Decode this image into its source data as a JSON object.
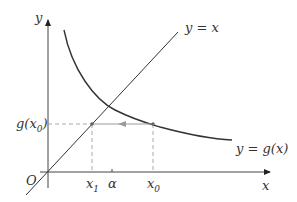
{
  "diagram": {
    "type": "fixed-point-iteration",
    "axes": {
      "x_label": "x",
      "y_label": "y",
      "origin_label": "O"
    },
    "curves": [
      {
        "name": "identity-line",
        "label": "y = x"
      },
      {
        "name": "g-curve",
        "label": "y = g(x)"
      }
    ],
    "points": {
      "x0_label": "x",
      "x0_sub": "0",
      "x1_label": "x",
      "x1_sub": "1",
      "alpha_label": "α",
      "gx0_label_pre": "g(x",
      "gx0_sub": "0",
      "gx0_label_post": ")"
    },
    "colors": {
      "curve": "#333333",
      "axis": "#333333",
      "dashed": "#aaaaaa",
      "arrow": "#999999"
    }
  }
}
